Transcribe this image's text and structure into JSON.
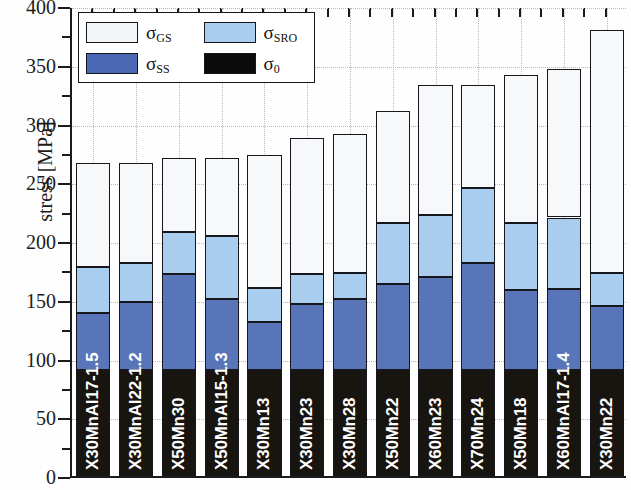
{
  "chart_data": {
    "type": "bar",
    "subtype": "stacked-bar",
    "title": "",
    "xlabel": "",
    "ylabel": "stress [MPa]",
    "ylim": [
      0,
      400
    ],
    "ytick_major_step": 50,
    "ytick_minor_step": 25,
    "ytick_labels": [
      "0",
      "50",
      "100",
      "150",
      "200",
      "250",
      "300",
      "350",
      "400"
    ],
    "grid": "horizontal and vertical dotted gridlines",
    "legend_position": "top-left inside plot",
    "stack_order_bottom_to_top": [
      "sigma_0",
      "sigma_SS",
      "sigma_SRO",
      "sigma_GS"
    ],
    "categories": [
      "X30MnAl17-1.5",
      "X30MnAl22-1.2",
      "X50Mn30",
      "X50MnAl15-1.3",
      "X30Mn13",
      "X30Mn23",
      "X30Mn28",
      "X50Mn22",
      "X60Mn23",
      "X70Mn24",
      "X50Mn18",
      "X60MnAl17-1.4",
      "X30Mn22"
    ],
    "series": [
      {
        "name": "sigma_0",
        "label": "σ",
        "sub": "0",
        "color": "#18140f",
        "cumulative_top": [
          90,
          90,
          90,
          90,
          90,
          90,
          90,
          90,
          90,
          90,
          90,
          90,
          90
        ],
        "values": [
          90,
          90,
          90,
          90,
          90,
          90,
          90,
          90,
          90,
          90,
          90,
          90,
          90
        ]
      },
      {
        "name": "sigma_SS",
        "label": "σ",
        "sub": "SS",
        "color": "#5775b8",
        "cumulative_top": [
          139,
          148,
          172,
          151,
          131,
          146,
          151,
          163,
          169,
          181,
          158,
          159,
          145
        ],
        "values": [
          49,
          58,
          82,
          61,
          41,
          56,
          61,
          73,
          79,
          91,
          68,
          69,
          55
        ]
      },
      {
        "name": "sigma_SRO",
        "label": "σ",
        "sub": "SRO",
        "color": "#a8cdef",
        "cumulative_top": [
          178,
          181,
          208,
          204,
          160,
          172,
          173,
          215,
          222,
          245,
          215,
          220,
          173
        ],
        "values": [
          39,
          33,
          36,
          53,
          29,
          26,
          22,
          52,
          53,
          64,
          57,
          61,
          28
        ]
      },
      {
        "name": "sigma_GS",
        "label": "σ",
        "sub": "GS",
        "color": "#f7f8fa",
        "cumulative_top": [
          266,
          266,
          271,
          271,
          273,
          288,
          291,
          311,
          333,
          333,
          341,
          346,
          380
        ],
        "values": [
          88,
          85,
          63,
          67,
          113,
          116,
          118,
          96,
          111,
          88,
          126,
          126,
          207
        ]
      }
    ],
    "totals": [
      266,
      266,
      271,
      271,
      273,
      288,
      291,
      311,
      333,
      333,
      341,
      346,
      380
    ]
  },
  "legend": {
    "items": [
      {
        "key": "gs",
        "symbol": "σ",
        "sub": "GS",
        "swatch": "#f3f6f9"
      },
      {
        "key": "sro",
        "symbol": "σ",
        "sub": "SRO",
        "swatch": "#a8cdef"
      },
      {
        "key": "ss",
        "symbol": "σ",
        "sub": "SS",
        "swatch": "#4a68b3"
      },
      {
        "key": "zero",
        "symbol": "σ",
        "sub": "0",
        "swatch": "#0b0b0b"
      }
    ]
  },
  "axis": {
    "y_title": "stress [MPa]"
  }
}
